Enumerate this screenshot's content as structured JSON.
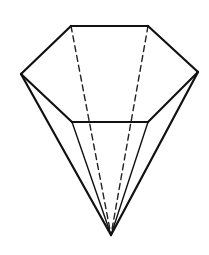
{
  "figure": {
    "vertices": {
      "top_left": [
        71,
        26
      ],
      "top_right": [
        148,
        26
      ],
      "right": [
        198,
        72
      ],
      "bottom_right": [
        148,
        122
      ],
      "bottom_left": [
        72,
        122
      ],
      "left": [
        21,
        74
      ],
      "apex": [
        111,
        235
      ]
    },
    "solid_edges": [
      [
        "top_left",
        "top_right"
      ],
      [
        "top_right",
        "right"
      ],
      [
        "right",
        "bottom_right"
      ],
      [
        "bottom_right",
        "bottom_left"
      ],
      [
        "bottom_left",
        "left"
      ],
      [
        "left",
        "top_left"
      ],
      [
        "left",
        "apex"
      ],
      [
        "right",
        "apex"
      ]
    ],
    "thin_edges": [
      [
        "bottom_left",
        "apex"
      ],
      [
        "bottom_right",
        "apex"
      ]
    ],
    "hidden_edges": [
      [
        "top_left",
        "apex"
      ],
      [
        "top_right",
        "apex"
      ]
    ],
    "line_color": "#111111",
    "background": "#ffffff"
  }
}
